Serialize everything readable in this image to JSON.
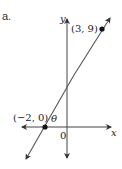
{
  "figure": {
    "part_label": "a.",
    "axes": {
      "x_label": "x",
      "y_label": "y",
      "origin_label": "0"
    },
    "points": [
      {
        "label": "(3, 9)",
        "x": 3,
        "y": 9
      },
      {
        "label": "(−2, 0)",
        "x": -2,
        "y": 0
      }
    ],
    "angle_label": "θ",
    "colors": {
      "axis": "#333333",
      "line": "#555555",
      "point": "#111111"
    }
  }
}
